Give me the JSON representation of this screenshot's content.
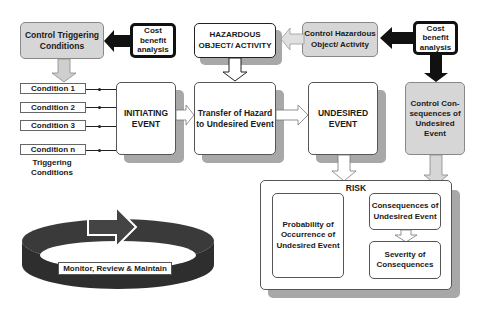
{
  "diagram": {
    "control_triggering": "Control Triggering Conditions",
    "cost_benefit_left": "Cost benefit analysis",
    "hazardous_object": "HAZARDOUS OBJECT/ ACTIVITY",
    "control_hazardous": "Control Hazardous Object/ Activity",
    "cost_benefit_right": "Cost benefit analysis",
    "conditions": [
      "Condition 1",
      "Condition 2",
      "Condition 3",
      "Condition n"
    ],
    "triggering_conditions_label": "Triggering Conditions",
    "initiating_event": "INITIATING EVENT",
    "transfer": "Transfer of Hazard to Undesired Event",
    "undesired_event": "UNDESIRED EVENT",
    "control_consequences": "Control Con-sequences of Undesired Event",
    "risk": "RISK",
    "probability": "Probability of Occurrence of Undesired Event",
    "consequences": "Consequences of Undesired Event",
    "severity": "Severity of Consequences",
    "monitor": "Monitor, Review & Maintain"
  },
  "colors": {
    "grey_box": "#d6d6d6",
    "shadow": "#a8a8a8",
    "ring": "#3a3a3a"
  }
}
